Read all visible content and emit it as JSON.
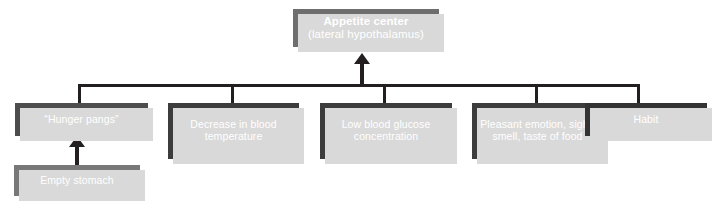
{
  "diagram": {
    "title_box": {
      "title": "Appetite center",
      "subtitle": "(lateral hypothalamus)"
    },
    "causes": [
      {
        "label": "“Hunger pangs”"
      },
      {
        "label": "Decrease in blood temperature"
      },
      {
        "label": "Low blood glucose concentration"
      },
      {
        "label": "Pleasant emotion, sight, smell, taste of food"
      },
      {
        "label": "Habit"
      }
    ],
    "source": {
      "label": "Empty stomach"
    },
    "colors": {
      "background": "#ffffff",
      "line": "#231f20",
      "shadow": "#d9d9d9",
      "appetite_box": "#6e6e6e",
      "hunger_pangs_box": "#4d4d4d",
      "cause_box": "#3c3c3c",
      "habit_box": "#333333",
      "empty_stomach_box": "#787878",
      "box_text": "#ffffff"
    },
    "icons": {
      "arrow_to_appetite": "arrow-up-icon",
      "arrow_to_hunger": "arrow-up-icon"
    }
  }
}
